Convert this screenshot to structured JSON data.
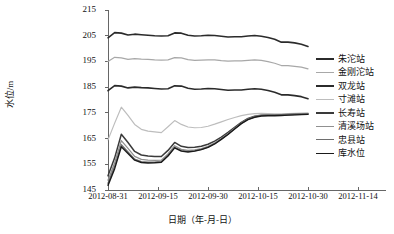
{
  "chart_data": {
    "type": "line",
    "title": "",
    "xlabel": "日期（年-月-日）",
    "ylabel": "水位/m",
    "ylim": [
      145,
      215
    ],
    "yticks": [
      145,
      155,
      165,
      175,
      185,
      195,
      205,
      215
    ],
    "xlim": [
      "2012-08-31",
      "2012-11-14"
    ],
    "xticks": [
      "2012-08-31",
      "2012-09-15",
      "2012-09-30",
      "2012-10-15",
      "2012-10-30",
      "2012-11-14"
    ],
    "grid": false,
    "legend_position": "right",
    "x": [
      "2012-08-31",
      "2012-09-02",
      "2012-09-04",
      "2012-09-06",
      "2012-09-08",
      "2012-09-10",
      "2012-09-12",
      "2012-09-14",
      "2012-09-16",
      "2012-09-18",
      "2012-09-20",
      "2012-09-22",
      "2012-09-24",
      "2012-09-26",
      "2012-09-28",
      "2012-09-30",
      "2012-10-02",
      "2012-10-04",
      "2012-10-06",
      "2012-10-08",
      "2012-10-10",
      "2012-10-12",
      "2012-10-14",
      "2012-10-16",
      "2012-10-18",
      "2012-10-20",
      "2012-10-22",
      "2012-10-24",
      "2012-10-26",
      "2012-10-28",
      "2012-10-30"
    ],
    "series": [
      {
        "name": "朱沱站",
        "color": "#2b2b2b",
        "width": 1.6,
        "values": [
          204.2,
          206.2,
          206.0,
          205.3,
          205.6,
          205.4,
          205.2,
          205.0,
          204.9,
          205.0,
          206.1,
          206.0,
          205.2,
          204.9,
          205.0,
          205.2,
          205.1,
          204.8,
          204.5,
          204.6,
          204.6,
          204.9,
          205.1,
          204.8,
          204.3,
          203.6,
          202.5,
          202.5,
          202.2,
          201.7,
          200.8
        ]
      },
      {
        "name": "金刚沱站",
        "color": "#a8a8a8",
        "width": 1.2,
        "values": [
          195.0,
          196.6,
          196.4,
          195.8,
          196.1,
          195.9,
          195.8,
          195.6,
          195.5,
          195.6,
          196.5,
          196.4,
          195.7,
          195.4,
          195.5,
          195.6,
          195.6,
          195.3,
          195.1,
          195.2,
          195.2,
          195.4,
          195.6,
          195.4,
          194.9,
          194.3,
          193.4,
          193.4,
          193.1,
          192.8,
          192.1
        ]
      },
      {
        "name": "双龙站",
        "color": "#2b2b2b",
        "width": 1.6,
        "values": [
          183.6,
          185.6,
          185.4,
          184.7,
          185.0,
          184.8,
          184.7,
          184.5,
          184.3,
          184.4,
          185.5,
          185.4,
          184.6,
          184.2,
          184.3,
          184.5,
          184.4,
          184.1,
          183.8,
          183.9,
          183.9,
          184.2,
          184.4,
          184.2,
          183.7,
          183.0,
          182.0,
          182.0,
          181.7,
          181.3,
          180.5
        ]
      },
      {
        "name": "寸滩站",
        "color": "#bdbdbd",
        "width": 1.2,
        "values": [
          164.5,
          171.0,
          177.2,
          174.0,
          170.5,
          168.6,
          167.9,
          167.6,
          167.3,
          169.6,
          172.0,
          170.5,
          169.5,
          169.2,
          169.3,
          169.8,
          170.6,
          171.5,
          172.4,
          173.2,
          173.9,
          174.4,
          174.7,
          174.8,
          174.7,
          174.6,
          174.6,
          174.7,
          174.8,
          174.9,
          175.0
        ]
      },
      {
        "name": "长寿站",
        "color": "#3a3a3a",
        "width": 1.5,
        "values": [
          150.5,
          157.5,
          166.7,
          163.5,
          160.0,
          158.6,
          158.2,
          158.0,
          158.0,
          160.4,
          163.5,
          162.0,
          161.5,
          161.6,
          162.0,
          162.8,
          164.0,
          165.6,
          167.4,
          169.4,
          171.3,
          172.8,
          173.7,
          174.1,
          174.2,
          174.2,
          174.3,
          174.4,
          174.5,
          174.6,
          174.7
        ]
      },
      {
        "name": "清溪场站",
        "color": "#909090",
        "width": 1.3,
        "values": [
          148.8,
          155.6,
          164.2,
          161.2,
          158.1,
          156.9,
          156.6,
          156.5,
          156.6,
          159.0,
          162.2,
          160.8,
          160.4,
          160.6,
          161.1,
          162.0,
          163.3,
          165.0,
          166.9,
          169.0,
          171.0,
          172.6,
          173.5,
          174.0,
          174.1,
          174.1,
          174.2,
          174.3,
          174.4,
          174.5,
          174.6
        ]
      },
      {
        "name": "忠县站",
        "color": "#6e6e6e",
        "width": 1.3,
        "values": [
          147.6,
          154.2,
          162.6,
          159.8,
          157.0,
          156.0,
          155.8,
          155.8,
          156.0,
          158.4,
          161.6,
          160.3,
          160.0,
          160.2,
          160.8,
          161.7,
          163.0,
          164.8,
          166.7,
          168.8,
          170.9,
          172.5,
          173.4,
          173.9,
          174.0,
          174.0,
          174.1,
          174.2,
          174.3,
          174.4,
          174.5
        ]
      },
      {
        "name": "库水位",
        "color": "#1a1a1a",
        "width": 1.4,
        "values": [
          146.8,
          153.3,
          161.8,
          159.2,
          156.6,
          155.7,
          155.5,
          155.6,
          155.8,
          158.2,
          161.4,
          160.1,
          159.8,
          160.1,
          160.7,
          161.6,
          162.9,
          164.7,
          166.6,
          168.7,
          170.8,
          172.4,
          173.3,
          173.8,
          173.9,
          173.9,
          174.0,
          174.1,
          174.2,
          174.3,
          174.4
        ]
      }
    ]
  }
}
